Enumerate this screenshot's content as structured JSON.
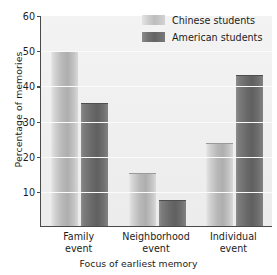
{
  "chart_data": {
    "type": "bar",
    "title": "",
    "subtitle": "",
    "xlabel": "Focus of earliest memory",
    "ylabel": "Percentage of memories",
    "categories": [
      "Family event",
      "Neighborhood event",
      "Individual event"
    ],
    "category_lines": [
      [
        "Family",
        "event"
      ],
      [
        "Neighborhood",
        "event"
      ],
      [
        "Individual",
        "event"
      ]
    ],
    "series": [
      {
        "name": "Chinese students",
        "values": [
          49.4,
          14.8,
          23.4
        ],
        "color": "#bdbdbd"
      },
      {
        "name": "American students",
        "values": [
          34.6,
          7.0,
          42.8
        ],
        "color": "#6a6a6a"
      }
    ],
    "ylim": [
      0,
      60
    ],
    "yticks": [
      10,
      20,
      30,
      40,
      50,
      60
    ],
    "ytick_labels": [
      "10",
      "20",
      "30",
      "40",
      "50",
      "60"
    ],
    "xlim_grouped": true,
    "grid": true,
    "grid_axis": "y",
    "legend_position": "top-right",
    "plot_background": "#f1f1f1",
    "axis_color": "#4a4a4a"
  },
  "legend": {
    "entries": [
      {
        "label": "Chinese students",
        "swatch": "light"
      },
      {
        "label": "American students",
        "swatch": "dark"
      }
    ]
  }
}
